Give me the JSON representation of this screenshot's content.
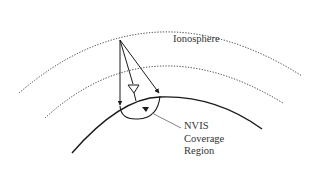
{
  "diagram": {
    "labels": {
      "ionosphere": "Ionosphere",
      "coverage_line1": "NVIS",
      "coverage_line2": "Coverage",
      "coverage_line3": "Region"
    },
    "elements": {
      "ionosphere_layers": 2,
      "ray_paths": 3,
      "antenna": "triangle-antenna-icon"
    },
    "colors": {
      "line": "#1a1a1a",
      "dotted": "#333333",
      "text": "#333333",
      "pointer": "#777777"
    }
  }
}
